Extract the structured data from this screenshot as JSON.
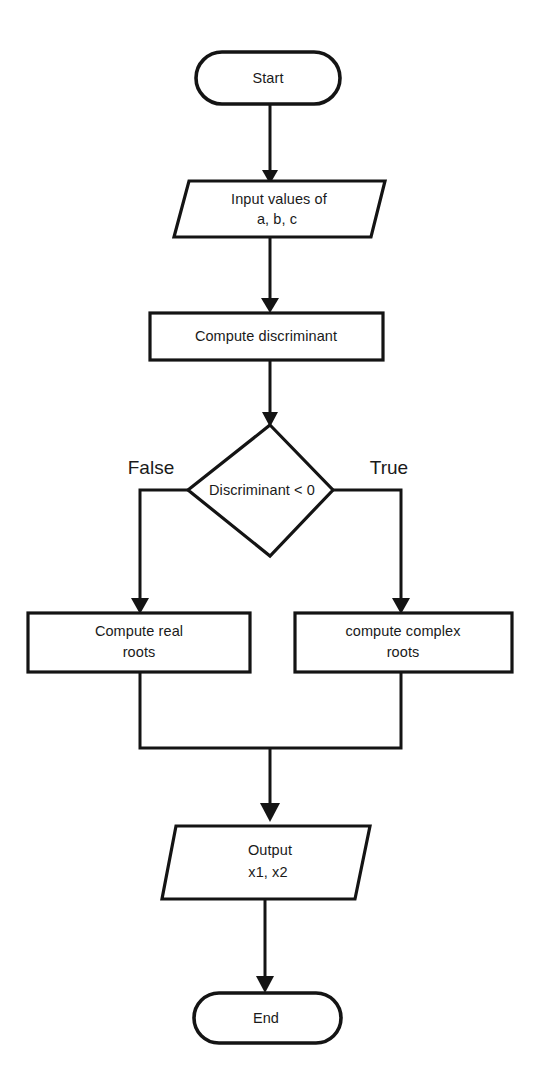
{
  "diagram": {
    "type": "flowchart",
    "orientation": "top-to-bottom",
    "line_color": "#141414",
    "fill_color": "#ffffff",
    "text_color": "#1a1a1a",
    "nodes": [
      {
        "id": "start",
        "shape": "terminator",
        "label": "Start"
      },
      {
        "id": "input",
        "shape": "parallelogram",
        "label_line1": "Input values of",
        "label_line2": "a, b, c"
      },
      {
        "id": "compute-discriminant",
        "shape": "rectangle",
        "label": "Compute discriminant"
      },
      {
        "id": "decision",
        "shape": "diamond",
        "label": "Discriminant < 0"
      },
      {
        "id": "compute-real-roots",
        "shape": "rectangle",
        "label_line1": "Compute real",
        "label_line2": "roots"
      },
      {
        "id": "compute-complex-roots",
        "shape": "rectangle",
        "label_line1": "compute complex",
        "label_line2": "roots"
      },
      {
        "id": "output",
        "shape": "parallelogram",
        "label_line1": "Output",
        "label_line2": "x1, x2"
      },
      {
        "id": "end",
        "shape": "terminator",
        "label": "End"
      }
    ],
    "edge_labels": {
      "false_branch": "False",
      "true_branch": "True"
    }
  }
}
